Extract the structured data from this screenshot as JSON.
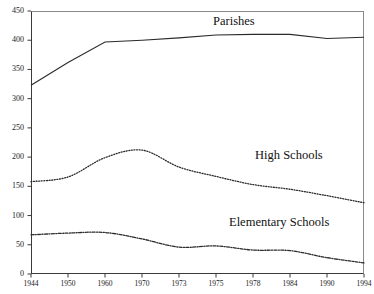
{
  "chart": {
    "title": "",
    "background_color": "#ffffff",
    "axis_color": "#3a3a3a"
  },
  "chart_data": {
    "type": "line",
    "title": "",
    "xlabel": "",
    "ylabel": "",
    "ylim": [
      0,
      450
    ],
    "ytick_step": 50,
    "grid": false,
    "legend_position": "inline-annotation",
    "categories": [
      "1944",
      "1950",
      "1960",
      "1970",
      "1973",
      "1975",
      "1978",
      "1984",
      "1990",
      "1994"
    ],
    "yticks": [
      "0",
      "50",
      "100",
      "150",
      "200",
      "250",
      "300",
      "350",
      "400",
      "450"
    ],
    "series": [
      {
        "name": "Parishes",
        "style": "solid",
        "color": "#2b2b2b",
        "values": [
          323,
          362,
          397,
          400,
          404,
          409,
          410,
          410,
          403,
          405
        ]
      },
      {
        "name": "High Schools",
        "style": "dotted",
        "color": "#2b2b2b",
        "values": [
          158,
          166,
          199,
          212,
          183,
          167,
          153,
          145,
          134,
          122
        ]
      },
      {
        "name": "Elementary Schools",
        "style": "dash-dot",
        "color": "#2b2b2b",
        "values": [
          67,
          70,
          71,
          60,
          46,
          48,
          41,
          40,
          28,
          19
        ]
      }
    ],
    "annotations": [
      {
        "text": "Parishes",
        "series": "Parishes"
      },
      {
        "text": "High Schools",
        "series": "High Schools"
      },
      {
        "text": "Elementary Schools",
        "series": "Elementary Schools"
      }
    ]
  }
}
